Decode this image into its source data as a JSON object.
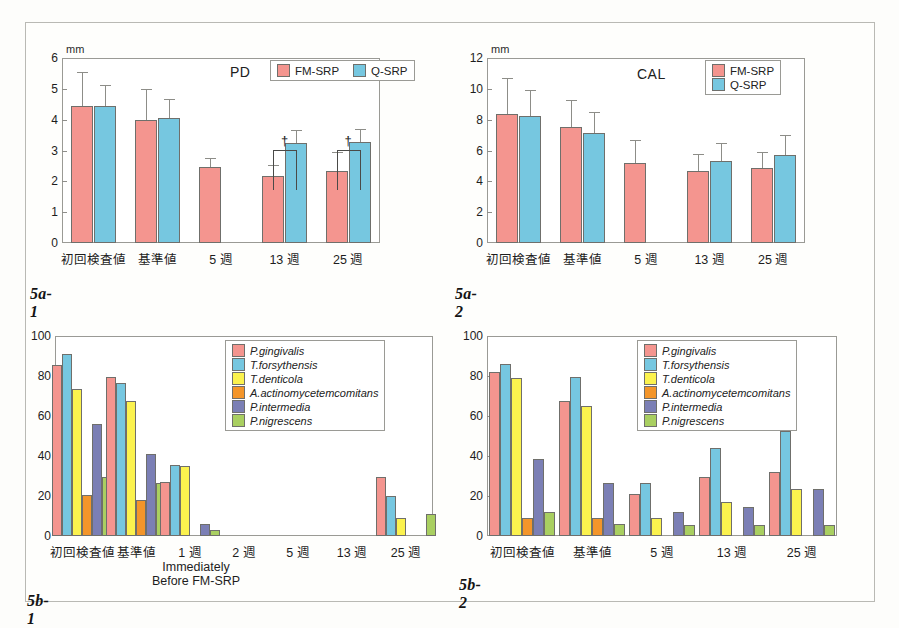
{
  "figure": {
    "panels": [
      {
        "id": "5a-1",
        "label": "5a-1"
      },
      {
        "id": "5a-2",
        "label": "5a-2"
      },
      {
        "id": "5b-1",
        "label": "5b-1"
      },
      {
        "id": "5b-2",
        "label": "5b-2"
      }
    ]
  },
  "colors": {
    "fm_srp": "#f4958f",
    "q_srp": "#76c7e0",
    "p_gingivalis": "#f4958f",
    "t_forsythensis": "#76c7e0",
    "t_denticola": "#fbf24e",
    "a_actinomycetemcomitans": "#f3952a",
    "p_intermedia": "#7b7fb5",
    "p_nigrescens": "#a9cf61",
    "axis": "#9a9a95",
    "frame": "#b9b9b4"
  },
  "chart_data": [
    {
      "id": "5a-1",
      "type": "bar",
      "title": "PD",
      "ylabel": "mm",
      "ylim": [
        0,
        6
      ],
      "yticks": [
        "0",
        "1",
        "2",
        "3",
        "4",
        "5",
        "6"
      ],
      "grid": false,
      "legend_position": "top-right",
      "categories": [
        "初回検査値",
        "基準値",
        "5 週",
        "13 週",
        "25 週"
      ],
      "series": [
        {
          "name": "FM-SRP",
          "color_key": "fm_srp",
          "values": [
            4.43,
            3.98,
            2.46,
            2.18,
            2.35
          ],
          "errors": [
            1.13,
            1.01,
            0.3,
            0.35,
            0.6
          ]
        },
        {
          "name": "Q-SRP",
          "color_key": "q_srp",
          "values": [
            4.45,
            4.04,
            null,
            3.25,
            3.27
          ],
          "errors": [
            0.68,
            0.64,
            null,
            0.42,
            0.43
          ]
        }
      ],
      "annotations": [
        {
          "symbol": "†",
          "category": "13 週"
        },
        {
          "symbol": "†",
          "category": "25 週"
        }
      ]
    },
    {
      "id": "5a-2",
      "type": "bar",
      "title": "CAL",
      "ylabel": "mm",
      "ylim": [
        0,
        12
      ],
      "yticks": [
        "0",
        "2",
        "4",
        "6",
        "8",
        "10",
        "12"
      ],
      "grid": false,
      "legend_position": "top-right",
      "categories": [
        "初回検査値",
        "基準値",
        "5 週",
        "13 週",
        "25 週"
      ],
      "series": [
        {
          "name": "FM-SRP",
          "color_key": "fm_srp",
          "values": [
            8.35,
            7.5,
            5.2,
            4.7,
            4.85
          ],
          "errors": [
            2.35,
            1.75,
            1.45,
            1.1,
            1.05
          ]
        },
        {
          "name": "Q-SRP",
          "color_key": "q_srp",
          "values": [
            8.22,
            7.15,
            null,
            5.33,
            5.72
          ],
          "errors": [
            1.7,
            1.35,
            null,
            1.15,
            1.3
          ]
        }
      ],
      "annotations": []
    },
    {
      "id": "5b-1",
      "type": "bar",
      "title": "",
      "ylabel": "",
      "ylim": [
        0,
        100
      ],
      "yticks": [
        "0",
        "20",
        "40",
        "60",
        "80",
        "100"
      ],
      "grid": false,
      "legend_position": "top-right",
      "categories": [
        "初回検査値",
        "基準値",
        "1 週",
        "2 週",
        "5 週",
        "13 週",
        "25 週"
      ],
      "xnote": "Immediately\nBefore FM-SRP",
      "xnote_line1": "Immediately",
      "xnote_line2": "Before FM-SRP",
      "xnote_category": "1 週",
      "series": [
        {
          "name": "P.gingivalis",
          "color_key": "p_gingivalis",
          "values": [
            85.5,
            79.5,
            26.8,
            0,
            0,
            0,
            29.5
          ]
        },
        {
          "name": "T.forsythensis",
          "color_key": "t_forsythensis",
          "values": [
            91.0,
            76.5,
            35.3,
            0,
            0,
            0,
            20.0
          ]
        },
        {
          "name": "T.denticola",
          "color_key": "t_denticola",
          "values": [
            73.5,
            67.5,
            35.2,
            0,
            0,
            0,
            8.8
          ]
        },
        {
          "name": "A.actinomycetemcomitans",
          "color_key": "a_actinomycetemcomitans",
          "values": [
            20.6,
            17.8,
            0,
            0,
            0,
            0,
            0
          ]
        },
        {
          "name": "P.intermedia",
          "color_key": "p_intermedia",
          "values": [
            56.0,
            41.2,
            6.0,
            0,
            0,
            0,
            0
          ]
        },
        {
          "name": "P.nigrescens",
          "color_key": "p_nigrescens",
          "values": [
            29.5,
            26.7,
            2.9,
            0,
            0,
            0,
            11.0
          ]
        }
      ],
      "annotations": []
    },
    {
      "id": "5b-2",
      "type": "bar",
      "title": "",
      "ylabel": "",
      "ylim": [
        0,
        100
      ],
      "yticks": [
        "0",
        "20",
        "40",
        "60",
        "80",
        "100"
      ],
      "grid": false,
      "legend_position": "top-right",
      "categories": [
        "初回検査値",
        "基準値",
        "5 週",
        "13 週",
        "25 週"
      ],
      "series": [
        {
          "name": "P.gingivalis",
          "color_key": "p_gingivalis",
          "values": [
            82.0,
            67.5,
            20.8,
            29.3,
            32.0
          ]
        },
        {
          "name": "T.forsythensis",
          "color_key": "t_forsythensis",
          "values": [
            85.8,
            79.5,
            26.5,
            43.8,
            52.5
          ]
        },
        {
          "name": "T.denticola",
          "color_key": "t_denticola",
          "values": [
            79.2,
            65.0,
            8.8,
            17.2,
            23.5
          ]
        },
        {
          "name": "A.actinomycetemcomitans",
          "color_key": "a_actinomycetemcomitans",
          "values": [
            8.8,
            8.8,
            0,
            0,
            0
          ]
        },
        {
          "name": "P.intermedia",
          "color_key": "p_intermedia",
          "values": [
            38.3,
            26.6,
            11.9,
            14.5,
            23.5
          ]
        },
        {
          "name": "P.nigrescens",
          "color_key": "p_nigrescens",
          "values": [
            11.8,
            5.8,
            5.7,
            5.7,
            5.7
          ]
        }
      ],
      "annotations": []
    }
  ]
}
